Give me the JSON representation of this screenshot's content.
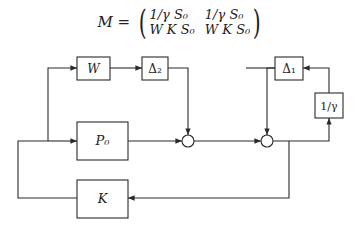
{
  "equation": {
    "lhs": "M =",
    "matrix": [
      [
        "1/γ S₀",
        "1/γ S₀"
      ],
      [
        "W K S₀",
        "W K S₀"
      ]
    ]
  },
  "blocks": {
    "w": "W",
    "delta2": "Δ₂",
    "p0": "P₀",
    "k": "K",
    "delta1": "Δ₁",
    "inv_gamma": "1/γ"
  },
  "colors": {
    "stroke": "#2a2a2a",
    "background": "#ffffff"
  }
}
